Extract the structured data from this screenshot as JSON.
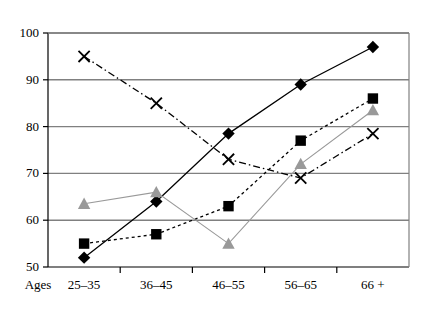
{
  "chart_data": {
    "type": "line",
    "title": "",
    "xlabel": "Ages",
    "ylabel": "",
    "categories": [
      "25–35",
      "36–45",
      "46–55",
      "56–65",
      "66 +"
    ],
    "ylim": [
      50,
      100
    ],
    "ytick_labels": [
      "50",
      "60",
      "70",
      "80",
      "90",
      "100"
    ],
    "ytick_values": [
      50,
      60,
      70,
      80,
      90,
      100
    ],
    "grid": true,
    "legend": "none",
    "series": [
      {
        "name": "diamond-series",
        "marker": "diamond",
        "line_style": "solid",
        "color": "#000000",
        "values": [
          52,
          64,
          78.5,
          89,
          97
        ]
      },
      {
        "name": "square-series",
        "marker": "square",
        "line_style": "dotted",
        "color": "#000000",
        "values": [
          55,
          57,
          63,
          77,
          86
        ]
      },
      {
        "name": "triangle-series",
        "marker": "triangle",
        "line_style": "solid-light",
        "color": "#999999",
        "values": [
          63.5,
          66,
          55,
          72,
          83.5
        ]
      },
      {
        "name": "x-series",
        "marker": "x",
        "line_style": "dash-dot",
        "color": "#000000",
        "values": [
          95,
          85,
          73,
          69,
          78.5
        ]
      }
    ]
  },
  "axis": {
    "prefix_label": "Ages"
  }
}
